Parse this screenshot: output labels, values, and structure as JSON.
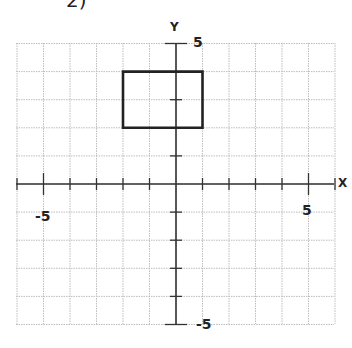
{
  "problem_label": "2)",
  "axes": {
    "x_label": "X",
    "y_label": "Y",
    "x_min": -6,
    "x_max": 6,
    "y_min": -5,
    "y_max": 5,
    "tick_labels": {
      "x_neg": "-5",
      "x_pos": "5",
      "y_pos": "5",
      "y_neg": "-5"
    }
  },
  "grid": {
    "on": true,
    "color": "#bdbdbd",
    "style": "dotted"
  },
  "shapes": [
    {
      "type": "rectangle",
      "vertices": [
        [
          -2,
          4
        ],
        [
          1,
          4
        ],
        [
          1,
          2
        ],
        [
          -2,
          2
        ]
      ],
      "stroke": "#222222"
    }
  ]
}
